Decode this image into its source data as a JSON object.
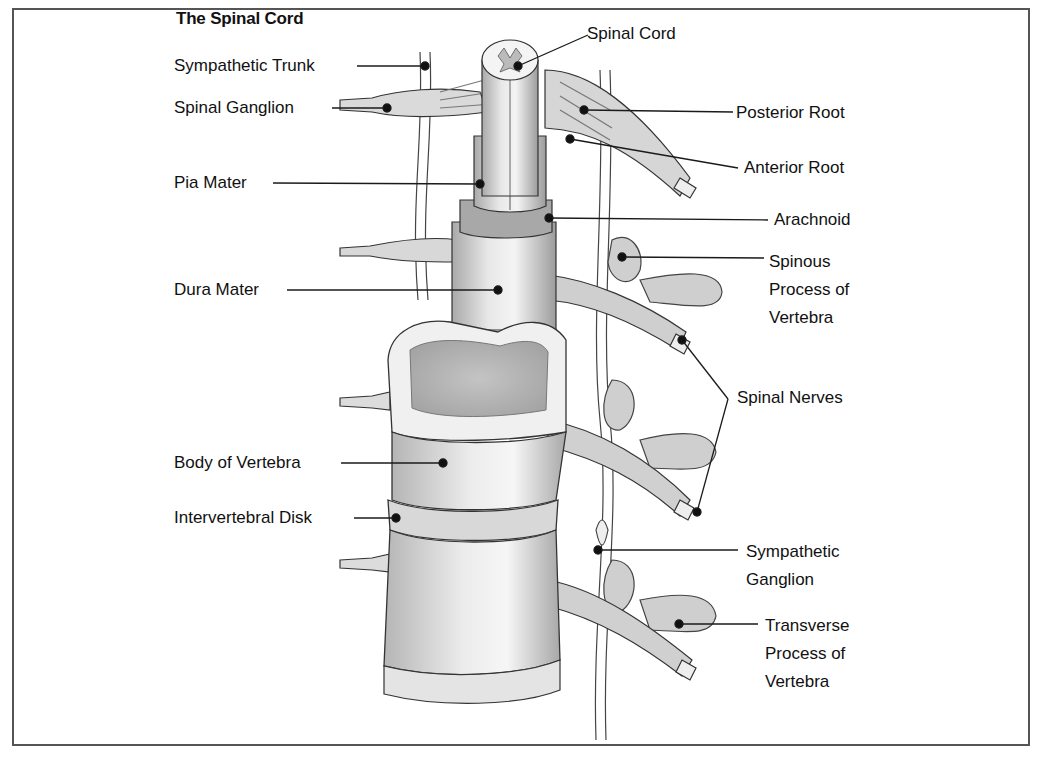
{
  "title": "The Spinal Cord",
  "labels": {
    "spinal_cord": "Spinal Cord",
    "sympathetic_trunk": "Sympathetic Trunk",
    "spinal_ganglion": "Spinal Ganglion",
    "posterior_root": "Posterior Root",
    "anterior_root": "Anterior Root",
    "pia_mater": "Pia Mater",
    "arachnoid": "Arachnoid",
    "spinous_process_1": "Spinous",
    "spinous_process_2": "Process of",
    "spinous_process_3": "Vertebra",
    "dura_mater": "Dura Mater",
    "spinal_nerves": "Spinal Nerves",
    "body_of_vertebra": "Body of Vertebra",
    "intervertebral_disk": "Intervertebral Disk",
    "sympathetic_ganglion_1": "Sympathetic",
    "sympathetic_ganglion_2": "Ganglion",
    "transverse_process_1": "Transverse",
    "transverse_process_2": "Process of",
    "transverse_process_3": "Vertebra"
  },
  "colors": {
    "line": "#1a1a1a",
    "frame": "#555555",
    "bone_light": "#e6e6e6",
    "bone_mid": "#c8c8c8",
    "bone_dark": "#9a9a9a"
  }
}
